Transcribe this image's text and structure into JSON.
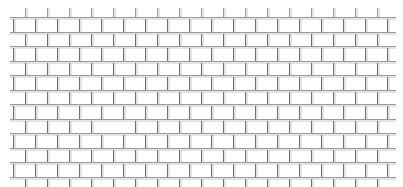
{
  "image": {
    "description": "Brick wall line-drawing pattern",
    "background": "#ffffff",
    "line_color": "#9a9a9a",
    "line_color_dark": "#6e6e6e"
  },
  "wall": {
    "left": 10,
    "right": 396,
    "top": 17,
    "row_pitch": 14.5,
    "rows": 11,
    "brick_width": 22,
    "first_offset": 25,
    "missing_brick": {
      "row": 7,
      "col": 4
    }
  }
}
